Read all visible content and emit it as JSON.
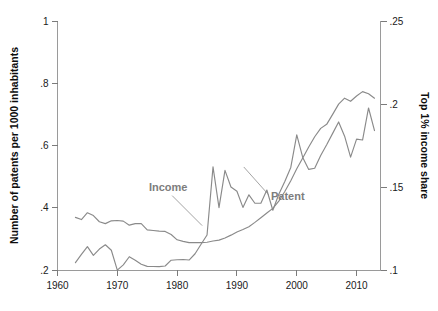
{
  "chart_data": {
    "type": "line",
    "title": "",
    "xlabel": "",
    "ylabel": "Number of patents per 1000 inhabitants",
    "y2label": "Top 1% income share",
    "xlim": [
      1960,
      2014
    ],
    "ylim": [
      0.2,
      1.0
    ],
    "y2lim": [
      0.1,
      0.25
    ],
    "grid": false,
    "legend_position": "inline-annotations",
    "xticks": [
      "1960",
      "1970",
      "1980",
      "1990",
      "2000",
      "2010"
    ],
    "xtick_values": [
      1960,
      1970,
      1980,
      1990,
      2000,
      2010
    ],
    "yticks": [
      ".2",
      ".4",
      ".6",
      ".8",
      "1"
    ],
    "ytick_values": [
      0.2,
      0.4,
      0.6,
      0.8,
      1.0
    ],
    "y2ticks": [
      ".1",
      ".15",
      ".2",
      ".25"
    ],
    "y2tick_values": [
      0.1,
      0.15,
      0.2,
      0.25
    ],
    "annotations": [
      {
        "text": "Income",
        "x": 1978.5,
        "y_axis": "left",
        "y": 0.455
      },
      {
        "text": "Patent",
        "x": 1998.5,
        "y_axis": "left",
        "y": 0.425
      }
    ],
    "series": [
      {
        "name": "Patent",
        "axis": "left",
        "color": "#8a8a8a",
        "x": [
          1963,
          1964,
          1965,
          1966,
          1967,
          1968,
          1969,
          1970,
          1971,
          1972,
          1973,
          1974,
          1975,
          1976,
          1977,
          1978,
          1979,
          1980,
          1981,
          1982,
          1983,
          1984,
          1985,
          1986,
          1987,
          1988,
          1989,
          1990,
          1991,
          1992,
          1993,
          1994,
          1995,
          1996,
          1997,
          1998,
          1999,
          2000,
          2001,
          2002,
          2003,
          2004,
          2005,
          2006,
          2007,
          2008,
          2009,
          2010,
          2011,
          2012,
          2013
        ],
        "values": [
          0.369,
          0.362,
          0.384,
          0.375,
          0.355,
          0.349,
          0.358,
          0.359,
          0.357,
          0.344,
          0.349,
          0.349,
          0.329,
          0.327,
          0.325,
          0.324,
          0.314,
          0.297,
          0.292,
          0.288,
          0.288,
          0.288,
          0.289,
          0.293,
          0.296,
          0.303,
          0.312,
          0.322,
          0.33,
          0.339,
          0.353,
          0.368,
          0.383,
          0.398,
          0.421,
          0.452,
          0.487,
          0.525,
          0.56,
          0.595,
          0.628,
          0.655,
          0.668,
          0.7,
          0.733,
          0.752,
          0.742,
          0.759,
          0.773,
          0.766,
          0.752
        ]
      },
      {
        "name": "Income",
        "axis": "right",
        "color": "#8a8a8a",
        "x": [
          1963,
          1964,
          1965,
          1966,
          1967,
          1968,
          1969,
          1970,
          1971,
          1972,
          1973,
          1974,
          1975,
          1976,
          1977,
          1978,
          1979,
          1980,
          1981,
          1982,
          1983,
          1984,
          1985,
          1986,
          1987,
          1988,
          1989,
          1990,
          1991,
          1992,
          1993,
          1994,
          1995,
          1996,
          1997,
          1998,
          1999,
          2000,
          2001,
          2002,
          2003,
          2004,
          2005,
          2006,
          2007,
          2008,
          2009,
          2010,
          2011,
          2012,
          2013
        ],
        "values": [
          0.1044,
          0.1094,
          0.1141,
          0.1088,
          0.1126,
          0.1152,
          0.1119,
          0.0999,
          0.1031,
          0.108,
          0.1059,
          0.1035,
          0.1022,
          0.1021,
          0.102,
          0.1024,
          0.1059,
          0.1062,
          0.1063,
          0.106,
          0.1098,
          0.1155,
          0.1211,
          0.1621,
          0.1376,
          0.16,
          0.15,
          0.1474,
          0.1377,
          0.1453,
          0.1402,
          0.1402,
          0.1482,
          0.136,
          0.1456,
          0.1533,
          0.1618,
          0.1814,
          0.1678,
          0.1606,
          0.1613,
          0.169,
          0.1754,
          0.1823,
          0.1892,
          0.1806,
          0.168,
          0.1788,
          0.1783,
          0.1976,
          0.184
        ]
      }
    ]
  }
}
